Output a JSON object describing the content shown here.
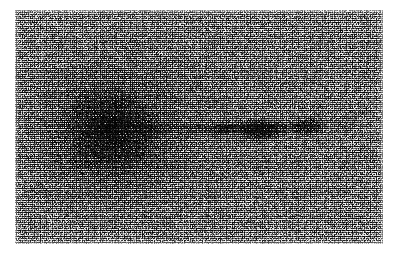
{
  "image": {
    "kind": "astronomical-photographic-plate",
    "title": "Grainy negative plate of an elliptical galaxy with a one-sided jet",
    "width_px": 399,
    "height_px": 257,
    "paper_background_color": "#ffffff",
    "plate": {
      "left_px": 15,
      "top_px": 10,
      "width_px": 368,
      "height_px": 234,
      "base_tone_color": "#b2b2b2",
      "darkest_tone_color": "#1a1a1a",
      "grain_description": "heavy single-pixel photographic emulsion grain"
    },
    "features": [
      {
        "name": "diffuse-halo",
        "label": "Diffuse elliptical galaxy halo",
        "center_x_pct": 26,
        "center_y_pct": 52,
        "radius_x_pct": 42,
        "radius_y_pct": 58,
        "peak_opacity": 0.52
      },
      {
        "name": "nucleus",
        "label": "Galaxy nucleus",
        "center_x_pct": 26,
        "center_y_pct": 51,
        "width_px": 34,
        "height_px": 17,
        "peak_opacity": 0.78
      },
      {
        "name": "jet-spine",
        "label": "Thin linear jet",
        "start_x_pct": 24,
        "end_x_pct": 84,
        "center_y_pct": 50.5,
        "thickness_px": 9
      }
    ],
    "knots": [
      {
        "name": "knot-nucleus",
        "label": "A (nucleus)",
        "x_pct": 25.5,
        "y_pct": 51.0,
        "w_px": 34,
        "h_px": 17,
        "opacity": 0.8,
        "blur_px": 3.6
      },
      {
        "name": "knot-b",
        "label": "B",
        "x_pct": 36.0,
        "y_pct": 51.0,
        "w_px": 22,
        "h_px": 11,
        "opacity": 0.52,
        "blur_px": 3.2
      },
      {
        "name": "knot-c",
        "label": "C",
        "x_pct": 48.5,
        "y_pct": 51.0,
        "w_px": 14,
        "h_px": 8,
        "opacity": 0.3,
        "blur_px": 3.0
      },
      {
        "name": "knot-d",
        "label": "D",
        "x_pct": 57.0,
        "y_pct": 51.2,
        "w_px": 20,
        "h_px": 11,
        "opacity": 0.58,
        "blur_px": 2.8
      },
      {
        "name": "knot-e",
        "label": "E",
        "x_pct": 66.5,
        "y_pct": 51.5,
        "w_px": 46,
        "h_px": 22,
        "opacity": 0.8,
        "blur_px": 3.4
      },
      {
        "name": "knot-f",
        "label": "F",
        "x_pct": 80.0,
        "y_pct": 49.5,
        "w_px": 34,
        "h_px": 18,
        "opacity": 0.74,
        "blur_px": 3.2
      },
      {
        "name": "knot-g",
        "label": "G (faint tail)",
        "x_pct": 89.0,
        "y_pct": 48.5,
        "w_px": 26,
        "h_px": 11,
        "opacity": 0.26,
        "blur_px": 3.6
      }
    ]
  }
}
